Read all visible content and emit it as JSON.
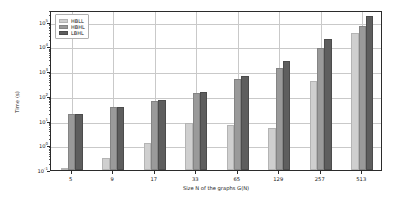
{
  "chart_data": {
    "type": "bar",
    "title": "",
    "xlabel": "Size N of the graphs G(N)",
    "ylabel": "Time (s)",
    "categories": [
      "5",
      "9",
      "17",
      "33",
      "65",
      "129",
      "257",
      "513"
    ],
    "yscale": "log",
    "ylim": [
      0.1,
      300000
    ],
    "ytick_labels": [
      "10⁻¹",
      "10⁰",
      "10¹",
      "10²",
      "10³",
      "10⁴",
      "10⁵"
    ],
    "ytick_values": [
      0.1,
      1,
      10,
      100,
      1000,
      10000,
      100000
    ],
    "grid": true,
    "legend_position": "upper left",
    "series": [
      {
        "name": "HBLL",
        "color": "#cfcfcf",
        "values": [
          0.1,
          0.3,
          1.2,
          8.0,
          6.5,
          5.0,
          420.0,
          35000.0
        ]
      },
      {
        "name": "HBHL",
        "color": "#9a9a9a",
        "values": [
          18.0,
          36.0,
          62.0,
          130.0,
          480.0,
          1300.0,
          9000.0,
          70000.0
        ]
      },
      {
        "name": "LBHL",
        "color": "#5e5e5e",
        "values": [
          18.0,
          36.0,
          70.0,
          150.0,
          650.0,
          2600.0,
          21000.0,
          170000.0
        ]
      }
    ]
  }
}
